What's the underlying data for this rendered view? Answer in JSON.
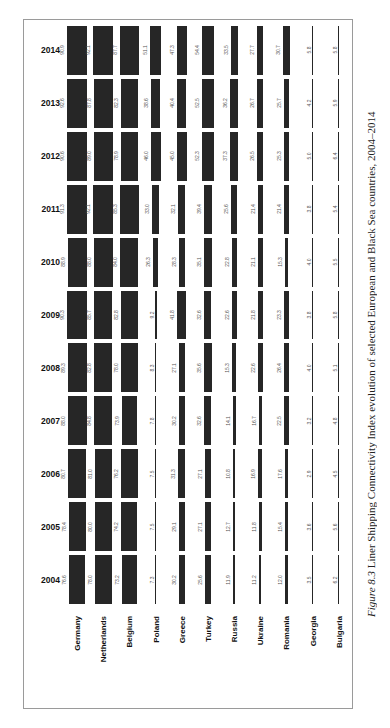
{
  "caption": {
    "figure_label": "Figure 8.3",
    "text": " Liner Shipping Connectivity Index evolution of selected European and Black Sea countries, 2004–2014"
  },
  "chart_data": {
    "type": "bar",
    "title": "Liner Shipping Connectivity Index evolution of selected European and Black Sea countries, 2004–2014",
    "orientation": "rotated 90° (page-landscape table of bars)",
    "xlabel": "",
    "ylabel": "",
    "categories": [
      "Germany",
      "Netherlands",
      "Belgium",
      "Poland",
      "Greece",
      "Turkey",
      "Russia",
      "Ukraine",
      "Romania",
      "Georgia",
      "Bulgaria"
    ],
    "years": [
      2014,
      2013,
      2012,
      2011,
      2010,
      2009,
      2008,
      2007,
      2006,
      2005,
      2004
    ],
    "series": [
      {
        "name": "2014",
        "values": [
          90.9,
          92.1,
          87.7,
          51.1,
          47.3,
          54.4,
          33.5,
          27.7,
          30.7,
          5.8,
          5.8
        ]
      },
      {
        "name": "2013",
        "values": [
          92.6,
          87.8,
          82.3,
          38.6,
          40.4,
          52.5,
          36.2,
          26.7,
          25.7,
          4.2,
          5.9
        ]
      },
      {
        "name": "2012",
        "values": [
          90.6,
          89.0,
          78.9,
          46.0,
          45.0,
          52.3,
          37.3,
          26.5,
          25.3,
          5.0,
          6.4
        ]
      },
      {
        "name": "2011",
        "values": [
          91.3,
          92.1,
          85.3,
          33.0,
          32.1,
          39.4,
          25.6,
          21.4,
          21.4,
          3.8,
          5.4
        ]
      },
      {
        "name": "2010",
        "values": [
          88.9,
          88.0,
          84.0,
          26.3,
          28.3,
          35.1,
          22.8,
          21.1,
          15.3,
          4.0,
          5.5
        ]
      },
      {
        "name": "2009",
        "values": [
          90.3,
          85.7,
          82.8,
          9.2,
          41.8,
          32.6,
          22.6,
          21.8,
          23.3,
          3.8,
          5.8
        ]
      },
      {
        "name": "2008",
        "values": [
          89.3,
          82.8,
          78.0,
          8.3,
          27.1,
          35.6,
          15.3,
          22.6,
          26.4,
          4.0,
          5.1
        ]
      },
      {
        "name": "2007",
        "values": [
          88.0,
          84.8,
          73.9,
          7.8,
          30.2,
          32.6,
          14.1,
          16.7,
          22.5,
          3.2,
          4.8
        ]
      },
      {
        "name": "2006",
        "values": [
          80.7,
          81.0,
          76.2,
          7.5,
          31.3,
          27.1,
          10.8,
          16.9,
          17.6,
          2.9,
          4.5
        ]
      },
      {
        "name": "2005",
        "values": [
          78.4,
          80.0,
          74.2,
          7.5,
          29.1,
          27.1,
          12.7,
          11.8,
          15.4,
          3.6,
          5.6
        ]
      },
      {
        "name": "2004",
        "values": [
          76.6,
          78.0,
          73.2,
          7.3,
          30.2,
          25.6,
          11.9,
          11.2,
          12.0,
          3.5,
          6.2
        ]
      }
    ],
    "legend": "none",
    "grid": false,
    "bar_color": "#262626"
  }
}
